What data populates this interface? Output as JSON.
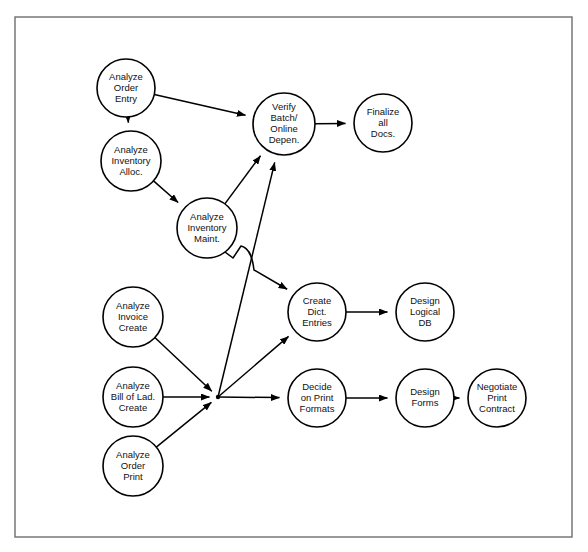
{
  "diagram": {
    "frame": {
      "x": 15,
      "y": 17,
      "width": 557,
      "height": 520,
      "color": "#6e6e6e"
    },
    "style": {
      "node_fill": "#ffffff",
      "node_stroke": "#000000",
      "edge_color": "#000000",
      "text_color": "#111111"
    },
    "nodes": [
      {
        "id": "analyze-order-entry",
        "lines": [
          "Analyze",
          "Order",
          "Entry"
        ],
        "cx": 126,
        "cy": 88,
        "r": 29
      },
      {
        "id": "analyze-inventory-alloc",
        "lines": [
          "Analyze",
          "Inventory",
          "Alloc."
        ],
        "cx": 131,
        "cy": 161,
        "r": 30
      },
      {
        "id": "analyze-inventory-maint",
        "lines": [
          "Analyze",
          "Inventory",
          "Maint."
        ],
        "cx": 207,
        "cy": 228,
        "r": 30
      },
      {
        "id": "verify-batch-online",
        "lines": [
          "Verify",
          "Batch/",
          "Online",
          "Depen."
        ],
        "cx": 284,
        "cy": 124,
        "r": 31
      },
      {
        "id": "finalize-all-docs",
        "lines": [
          "Finalize",
          "all",
          "Docs."
        ],
        "cx": 383,
        "cy": 123,
        "r": 29
      },
      {
        "id": "analyze-invoice-create",
        "lines": [
          "Analyze",
          "Invoice",
          "Create"
        ],
        "cx": 133,
        "cy": 317,
        "r": 30
      },
      {
        "id": "analyze-bill-of-lad",
        "lines": [
          "Analyze",
          "Bill of Lad.",
          "Create"
        ],
        "cx": 133,
        "cy": 397,
        "r": 30
      },
      {
        "id": "analyze-order-print",
        "lines": [
          "Analyze",
          "Order",
          "Print"
        ],
        "cx": 133,
        "cy": 466,
        "r": 30
      },
      {
        "id": "create-dict-entries",
        "lines": [
          "Create",
          "Dict.",
          "Entries"
        ],
        "cx": 317,
        "cy": 312,
        "r": 29
      },
      {
        "id": "design-logical-db",
        "lines": [
          "Design",
          "Logical",
          "DB"
        ],
        "cx": 425,
        "cy": 312,
        "r": 29
      },
      {
        "id": "decide-print-formats",
        "lines": [
          "Decide",
          "on Print",
          "Formats"
        ],
        "cx": 317,
        "cy": 398,
        "r": 29
      },
      {
        "id": "design-forms",
        "lines": [
          "Design",
          "Forms"
        ],
        "cx": 425,
        "cy": 398,
        "r": 29
      },
      {
        "id": "negotiate-print-contract",
        "lines": [
          "Negotiate",
          "Print",
          "Contract"
        ],
        "cx": 497,
        "cy": 398,
        "r": 29
      }
    ],
    "junction": {
      "id": "fan-junction",
      "x": 218,
      "y": 397
    },
    "edges": [
      {
        "id": "edge-order-entry-to-inventory-alloc",
        "from": "analyze-order-entry",
        "to": "analyze-inventory-alloc"
      },
      {
        "id": "edge-order-entry-to-verify",
        "from": "analyze-order-entry",
        "to": "verify-batch-online"
      },
      {
        "id": "edge-inventory-alloc-to-maint",
        "from": "analyze-inventory-alloc",
        "to": "analyze-inventory-maint"
      },
      {
        "id": "edge-inventory-maint-to-verify",
        "from": "analyze-inventory-maint",
        "to": "verify-batch-online"
      },
      {
        "id": "edge-inventory-maint-to-create-dict",
        "from": "analyze-inventory-maint",
        "to": "create-dict-entries",
        "curved": true,
        "hop": true
      },
      {
        "id": "edge-verify-to-finalize",
        "from": "verify-batch-online",
        "to": "finalize-all-docs"
      },
      {
        "id": "edge-invoice-create-to-junction",
        "from": "analyze-invoice-create",
        "to": "fan-junction"
      },
      {
        "id": "edge-bill-of-lad-to-junction",
        "from": "analyze-bill-of-lad",
        "to": "fan-junction"
      },
      {
        "id": "edge-order-print-to-junction",
        "from": "analyze-order-print",
        "to": "fan-junction"
      },
      {
        "id": "edge-junction-to-verify",
        "from": "fan-junction",
        "to": "verify-batch-online"
      },
      {
        "id": "edge-junction-to-create-dict",
        "from": "fan-junction",
        "to": "create-dict-entries"
      },
      {
        "id": "edge-junction-to-decide-print",
        "from": "fan-junction",
        "to": "decide-print-formats"
      },
      {
        "id": "edge-create-dict-to-design-db",
        "from": "create-dict-entries",
        "to": "design-logical-db"
      },
      {
        "id": "edge-decide-print-to-design-forms",
        "from": "decide-print-formats",
        "to": "design-forms"
      },
      {
        "id": "edge-design-forms-to-negotiate",
        "from": "design-forms",
        "to": "negotiate-print-contract"
      }
    ]
  }
}
